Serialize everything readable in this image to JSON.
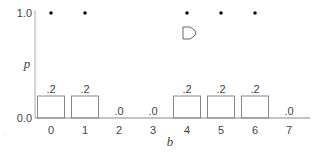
{
  "chart_data": {
    "type": "bar",
    "title": "",
    "xlabel": "b",
    "ylabel": "p",
    "ylim": [
      0.0,
      1.0
    ],
    "y_ticks": [
      "0.0",
      "1.0"
    ],
    "categories": [
      "0",
      "1",
      "2",
      "3",
      "4",
      "5",
      "6",
      "7"
    ],
    "series": [
      {
        "name": "bar values",
        "values": [
          0.2,
          0.2,
          0.0,
          0.0,
          0.2,
          0.2,
          0.2,
          0.0
        ],
        "labels": [
          ".2",
          ".2",
          ".0",
          ".0",
          ".2",
          ".2",
          ".2",
          ".0"
        ]
      },
      {
        "name": "dots at p=1.0",
        "type": "scatter",
        "x": [
          0,
          1,
          4,
          5,
          6
        ],
        "y": [
          1.0,
          1.0,
          1.0,
          1.0,
          1.0
        ]
      }
    ],
    "grid": false,
    "legend": null
  },
  "axis": {
    "xlabel": "b",
    "ylabel": "p",
    "ytick_top": "1.0",
    "ytick_bottom": "0.0"
  },
  "colors": {
    "axis": "#aaaaaa",
    "bar_stroke": "#888888",
    "dot": "#111111",
    "text": "#444444"
  }
}
